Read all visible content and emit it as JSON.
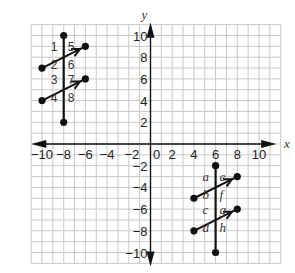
{
  "graph": {
    "x_axis_label": "x",
    "y_axis_label": "y",
    "x_range": [
      -11,
      12
    ],
    "y_range": [
      -11,
      11
    ],
    "grid_step": 1,
    "x_tick_labels": [
      {
        "value": -10,
        "label": "−10"
      },
      {
        "value": -8,
        "label": "−8"
      },
      {
        "value": -6,
        "label": "−6"
      },
      {
        "value": -4,
        "label": "−4"
      },
      {
        "value": -2,
        "label": "−2"
      },
      {
        "value": 0,
        "label": "0"
      },
      {
        "value": 2,
        "label": "2"
      },
      {
        "value": 4,
        "label": "4"
      },
      {
        "value": 6,
        "label": "6"
      },
      {
        "value": 8,
        "label": "8"
      },
      {
        "value": 10,
        "label": "10"
      }
    ],
    "y_tick_labels": [
      {
        "value": 10,
        "label": "10"
      },
      {
        "value": 8,
        "label": "8"
      },
      {
        "value": 6,
        "label": "6"
      },
      {
        "value": 4,
        "label": "4"
      },
      {
        "value": 2,
        "label": "2"
      },
      {
        "value": -2,
        "label": "−2"
      },
      {
        "value": -4,
        "label": "−4"
      },
      {
        "value": -6,
        "label": "−6"
      },
      {
        "value": -8,
        "label": "−8"
      },
      {
        "value": -10,
        "label": "−10"
      }
    ]
  },
  "figures": [
    {
      "name": "quadrant-ii-transversal",
      "transversal": {
        "from": [
          -8,
          10
        ],
        "to": [
          -8,
          2
        ]
      },
      "parallel_lines": [
        {
          "from": [
            -10,
            7
          ],
          "to": [
            -6,
            9
          ]
        },
        {
          "from": [
            -10,
            4
          ],
          "to": [
            -6,
            6
          ]
        }
      ],
      "angle_labels": [
        "1",
        "2",
        "5",
        "6",
        "3",
        "4",
        "7",
        "8"
      ]
    },
    {
      "name": "quadrant-iv-transversal",
      "transversal": {
        "from": [
          6,
          -2
        ],
        "to": [
          6,
          -10
        ]
      },
      "parallel_lines": [
        {
          "from": [
            4,
            -5
          ],
          "to": [
            8,
            -3
          ]
        },
        {
          "from": [
            4,
            -8
          ],
          "to": [
            8,
            -6
          ]
        }
      ],
      "angle_labels": [
        "a",
        "b",
        "e",
        "f",
        "c",
        "d",
        "g",
        "h"
      ]
    }
  ]
}
